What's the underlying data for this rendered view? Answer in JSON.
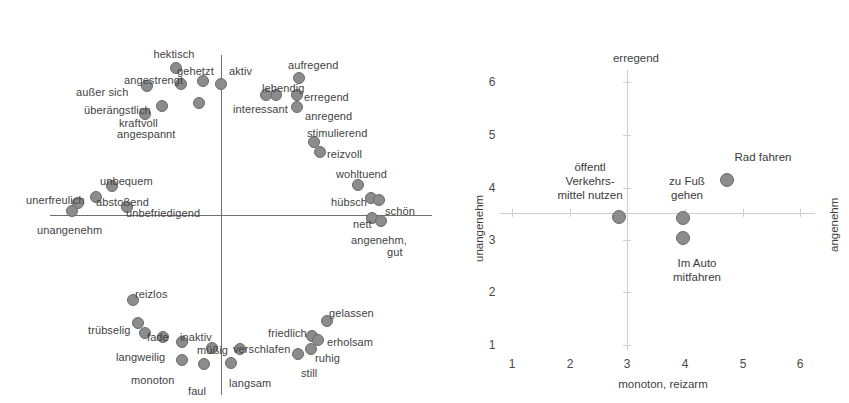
{
  "figure": {
    "left_plot": {
      "name": "semantic-differential-circumplex",
      "axis": {
        "h_start_x": 50,
        "h_end_x": 432,
        "h_y": 215,
        "v_x": 221,
        "v_start_y": 55,
        "v_end_y": 395
      },
      "points": [
        {
          "label": "hektisch",
          "lx": 174,
          "ly": 48,
          "lalign": "c",
          "x": 176,
          "y": 68
        },
        {
          "label": "gehetzt",
          "lx": 177,
          "ly": 65,
          "lalign": "l",
          "x": 203,
          "y": 81
        },
        {
          "label": "aktiv",
          "lx": 229,
          "ly": 65,
          "lalign": "l",
          "x": 221,
          "y": 84
        },
        {
          "label": "angestrengt",
          "lx": 124,
          "ly": 74,
          "lalign": "l",
          "x": 181,
          "y": 84
        },
        {
          "label": "außer sich",
          "lx": 76,
          "ly": 86,
          "lalign": "l",
          "x": 147,
          "y": 86
        },
        {
          "label": "überängstlich",
          "lx": 84,
          "ly": 104,
          "lalign": "l",
          "x": 162,
          "y": 106
        },
        {
          "label": "kraftvoll",
          "lx": 119,
          "ly": 117,
          "lalign": "l",
          "x": 199,
          "y": 103
        },
        {
          "label": "angespannt",
          "lx": 117,
          "ly": 128,
          "lalign": "l",
          "x": 145,
          "y": 114
        },
        {
          "label": "aufregend",
          "lx": 288,
          "ly": 59,
          "lalign": "l",
          "x": 299,
          "y": 78
        },
        {
          "label": "lebendig",
          "lx": 262,
          "ly": 82,
          "lalign": "l",
          "x": 276,
          "y": 95
        },
        {
          "label": "erregend",
          "lx": 304,
          "ly": 91,
          "lalign": "l",
          "x": 297,
          "y": 95
        },
        {
          "label": "interessant",
          "lx": 233,
          "ly": 103,
          "lalign": "l",
          "x": 266,
          "y": 95
        },
        {
          "label": "anregend",
          "lx": 305,
          "ly": 110,
          "lalign": "l",
          "x": 297,
          "y": 107
        },
        {
          "label": "stimulierend",
          "lx": 307,
          "ly": 127,
          "lalign": "l",
          "x": 314,
          "y": 142
        },
        {
          "label": "reizvoll",
          "lx": 327,
          "ly": 148,
          "lalign": "l",
          "x": 320,
          "y": 152
        },
        {
          "label": "wohltuend",
          "lx": 336,
          "ly": 168,
          "lalign": "l",
          "x": 358,
          "y": 185
        },
        {
          "label": "hübsch",
          "lx": 331,
          "ly": 196,
          "lalign": "l",
          "x": 371,
          "y": 198
        },
        {
          "label": "schön",
          "lx": 385,
          "ly": 205,
          "lalign": "l",
          "x": 379,
          "y": 200
        },
        {
          "label": "nett",
          "lx": 353,
          "ly": 218,
          "lalign": "l",
          "x": 372,
          "y": 218
        },
        {
          "label": "angenehm,",
          "lx": 351,
          "ly": 234,
          "lalign": "l",
          "x": 381,
          "y": 221
        },
        {
          "label": "gut",
          "lx": 387,
          "ly": 246,
          "lalign": "l"
        },
        {
          "label": "unbequem",
          "lx": 100,
          "ly": 175,
          "lalign": "l",
          "x": 112,
          "y": 186
        },
        {
          "label": "unerfreulich",
          "lx": 26,
          "ly": 194,
          "lalign": "l",
          "x": 78,
          "y": 203
        },
        {
          "label": "abstoßend",
          "lx": 96,
          "ly": 196,
          "lalign": "l",
          "x": 96,
          "y": 197
        },
        {
          "label": "unbefriedigend",
          "lx": 126,
          "ly": 207,
          "lalign": "l",
          "x": 127,
          "y": 207
        },
        {
          "label": "unangenehm",
          "lx": 37,
          "ly": 224,
          "lalign": "l",
          "x": 72,
          "y": 211
        },
        {
          "label": "reizlos",
          "lx": 135,
          "ly": 288,
          "lalign": "l",
          "x": 133,
          "y": 300
        },
        {
          "label": "trübselig",
          "lx": 88,
          "ly": 324,
          "lalign": "l",
          "x": 138,
          "y": 323
        },
        {
          "label": "fade",
          "lx": 147,
          "ly": 331,
          "lalign": "l",
          "x": 145,
          "y": 333
        },
        {
          "label": "inaktiv",
          "lx": 180,
          "ly": 331,
          "lalign": "l",
          "x": 182,
          "y": 342
        },
        {
          "label": "langweilig",
          "lx": 116,
          "ly": 351,
          "lalign": "l",
          "x": 163,
          "y": 337
        },
        {
          "label": "müßig",
          "lx": 197,
          "ly": 344,
          "lalign": "l",
          "x": 212,
          "y": 348
        },
        {
          "label": "monoton",
          "lx": 131,
          "ly": 374,
          "lalign": "l",
          "x": 182,
          "y": 360
        },
        {
          "label": "faul",
          "lx": 188,
          "ly": 385,
          "lalign": "l",
          "x": 204,
          "y": 364
        },
        {
          "label": "verschlafen",
          "lx": 233,
          "ly": 343,
          "lalign": "l",
          "x": 240,
          "y": 349
        },
        {
          "label": "langsam",
          "lx": 229,
          "ly": 377,
          "lalign": "l",
          "x": 231,
          "y": 363
        },
        {
          "label": "friedlich",
          "lx": 268,
          "ly": 327,
          "lalign": "l",
          "x": 312,
          "y": 336
        },
        {
          "label": "gelassen",
          "lx": 329,
          "ly": 307,
          "lalign": "l",
          "x": 327,
          "y": 321
        },
        {
          "label": "erholsam",
          "lx": 327,
          "ly": 336,
          "lalign": "l",
          "x": 318,
          "y": 340
        },
        {
          "label": "ruhig",
          "lx": 315,
          "ly": 352,
          "lalign": "l",
          "x": 311,
          "y": 349
        },
        {
          "label": "still",
          "lx": 301,
          "ly": 367,
          "lalign": "l",
          "x": 298,
          "y": 354
        }
      ]
    }
  },
  "chart_data": {
    "type": "scatter",
    "title": "",
    "xlabel": "monoton, reizarm",
    "ylabel_left": "unangenehm",
    "ylabel_right": "angenehm",
    "top_label": "erregend",
    "xlim": [
      1,
      6
    ],
    "ylim": [
      1,
      6
    ],
    "xticks": [
      1,
      2,
      3,
      4,
      5,
      6
    ],
    "yticks": [
      1,
      2,
      3,
      4,
      5,
      6
    ],
    "grid": true,
    "legend": "none",
    "points": [
      {
        "label": "öffentl\nVerkehrs-\nmittel nutzen",
        "x": 2.9,
        "y": 3.55,
        "px": 619,
        "py": 217,
        "lx": 590,
        "ly": 160
      },
      {
        "label": "zu Fuß\ngehen",
        "x": 4.0,
        "y": 3.55,
        "px": 683,
        "py": 218,
        "lx": 687,
        "ly": 174
      },
      {
        "label": "Im Auto\nmitfahren",
        "x": 4.0,
        "y": 3.1,
        "px": 683,
        "py": 238,
        "lx": 697,
        "ly": 256
      },
      {
        "label": "Rad fahren",
        "x": 4.75,
        "y": 4.15,
        "px": 727,
        "py": 180,
        "lx": 763,
        "ly": 150
      }
    ],
    "axis_geometry": {
      "x_pixels": {
        "1": 512,
        "2": 570,
        "3": 627,
        "4": 685,
        "5": 743,
        "6": 800
      },
      "y_pixels": {
        "1": 345,
        "2": 292,
        "3": 240,
        "4": 188,
        "5": 135,
        "6": 82
      },
      "h_axis_y": 213,
      "h_axis_x_start": 500,
      "h_axis_x_end": 815,
      "v_axis_x": 627,
      "v_axis_y_start": 70,
      "v_axis_y_end": 350
    }
  }
}
